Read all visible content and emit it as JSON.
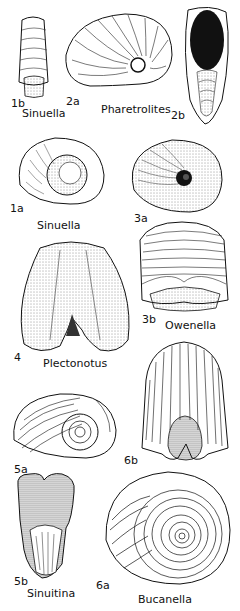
{
  "plate": {
    "figures": [
      {
        "id": "1b",
        "genus": "Sinuella",
        "view": "apertural-front"
      },
      {
        "id": "2a",
        "genus": "Pharetrolites",
        "view": "lateral"
      },
      {
        "id": "2b",
        "genus": "Pharetrolites",
        "view": "apertural"
      },
      {
        "id": "1a",
        "genus": "Sinuella",
        "view": "lateral"
      },
      {
        "id": "3a",
        "genus": "Owenella",
        "view": "lateral"
      },
      {
        "id": "3b",
        "genus": "Owenella",
        "view": "dorsal"
      },
      {
        "id": "4",
        "genus": "Plectonotus",
        "view": "dorsal"
      },
      {
        "id": "5a",
        "genus": "Sinuitina",
        "view": "lateral"
      },
      {
        "id": "5b",
        "genus": "Sinuitina",
        "view": "apertural"
      },
      {
        "id": "6b",
        "genus": "Bucanella",
        "view": "dorsal"
      },
      {
        "id": "6a",
        "genus": "Bucanella",
        "view": "lateral"
      }
    ],
    "labels": {
      "n1b": "1b",
      "g_sinuella_top": "Sinuella",
      "n2a": "2a",
      "g_pharetrolites": "Pharetrolites",
      "n2b": "2b",
      "n1a": "1a",
      "g_sinuella_mid": "Sinuella",
      "n3a": "3a",
      "n3b": "3b",
      "g_owenella": "Owenella",
      "n4": "4",
      "g_plectonotus": "Plectonotus",
      "n5a": "5a",
      "n6b": "6b",
      "n5b": "5b",
      "g_sinuitina": "Sinuitina",
      "n6a": "6a",
      "g_bucanella": "Bucanella"
    },
    "colors": {
      "ink": "#111111",
      "paper": "#ffffff",
      "shade": "#555555"
    }
  }
}
